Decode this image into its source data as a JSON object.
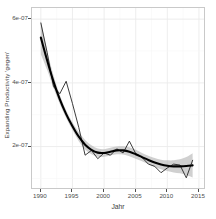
{
  "chart_data": {
    "type": "line",
    "title": "",
    "xlabel": "Jahr",
    "ylabel": "Expanding Productivity 'gegen'",
    "xlim": [
      1988.6,
      2015.8
    ],
    "ylim": [
      7e-08,
      6.35e-07
    ],
    "grid": true,
    "legend": null,
    "x_ticks": [
      1990,
      1995,
      2000,
      2005,
      2010,
      2015
    ],
    "x_tick_labels": [
      "1990",
      "1995",
      "2000",
      "2005",
      "2010",
      "2015"
    ],
    "y_ticks": [
      2e-07,
      4e-07,
      6e-07
    ],
    "y_tick_labels": [
      "2e-07",
      "4e-07",
      "6e-07"
    ],
    "series": [
      {
        "name": "observed",
        "style": "thin-black-line",
        "color": "#1a1a1a",
        "x": [
          1990,
          1991,
          1992,
          1993,
          1994,
          1995,
          1996,
          1997,
          1998,
          1999,
          2000,
          2001,
          2002,
          2003,
          2004,
          2005,
          2006,
          2007,
          2008,
          2009,
          2010,
          2011,
          2012,
          2013,
          2014
        ],
        "values": [
          5.88e-07,
          4.95e-07,
          3.88e-07,
          3.66e-07,
          4.05e-07,
          3.35e-07,
          2.6e-07,
          1.73e-07,
          1.88e-07,
          1.62e-07,
          1.8e-07,
          1.73e-07,
          1.93e-07,
          1.8e-07,
          2.17e-07,
          1.78e-07,
          1.66e-07,
          1.45e-07,
          1.38e-07,
          1.18e-07,
          1.33e-07,
          1.45e-07,
          1.42e-07,
          1.02e-07,
          1.57e-07
        ]
      },
      {
        "name": "loess-smooth",
        "style": "thick-black-curve",
        "color": "#000000",
        "x": [
          1990,
          1991,
          1992,
          1993,
          1994,
          1995,
          1996,
          1997,
          1998,
          1999,
          2000,
          2001,
          2002,
          2003,
          2004,
          2005,
          2006,
          2007,
          2008,
          2009,
          2010,
          2011,
          2012,
          2013,
          2014
        ],
        "values": [
          5.42e-07,
          4.7e-07,
          4.04e-07,
          3.48e-07,
          3.02e-07,
          2.64e-07,
          2.31e-07,
          2.06e-07,
          1.9e-07,
          1.81e-07,
          1.8e-07,
          1.84e-07,
          1.88e-07,
          1.88e-07,
          1.84e-07,
          1.76e-07,
          1.67e-07,
          1.58e-07,
          1.5e-07,
          1.44e-07,
          1.4e-07,
          1.38e-07,
          1.38e-07,
          1.39e-07,
          1.41e-07
        ]
      }
    ],
    "ribbon": {
      "name": "confidence-band",
      "color": "#b3b3b3",
      "opacity": 0.62,
      "x": [
        1990,
        1991,
        1992,
        1993,
        1994,
        1995,
        1996,
        1997,
        1998,
        1999,
        2000,
        2001,
        2002,
        2003,
        2004,
        2005,
        2006,
        2007,
        2008,
        2009,
        2010,
        2011,
        2012,
        2013,
        2014
      ],
      "upper": [
        5.95e-07,
        5e-07,
        4.24e-07,
        3.62e-07,
        3.14e-07,
        2.76e-07,
        2.45e-07,
        2.21e-07,
        2.04e-07,
        1.94e-07,
        1.92e-07,
        1.96e-07,
        2e-07,
        2.01e-07,
        1.98e-07,
        1.9e-07,
        1.8e-07,
        1.71e-07,
        1.64e-07,
        1.59e-07,
        1.57e-07,
        1.57e-07,
        1.6e-07,
        1.67e-07,
        1.79e-07
      ],
      "lower": [
        4.9e-07,
        4.4e-07,
        3.84e-07,
        3.34e-07,
        2.9e-07,
        2.52e-07,
        2.17e-07,
        1.91e-07,
        1.76e-07,
        1.68e-07,
        1.68e-07,
        1.72e-07,
        1.76e-07,
        1.75e-07,
        1.7e-07,
        1.62e-07,
        1.54e-07,
        1.45e-07,
        1.36e-07,
        1.29e-07,
        1.23e-07,
        1.19e-07,
        1.16e-07,
        1.11e-07,
        1.03e-07
      ]
    }
  }
}
